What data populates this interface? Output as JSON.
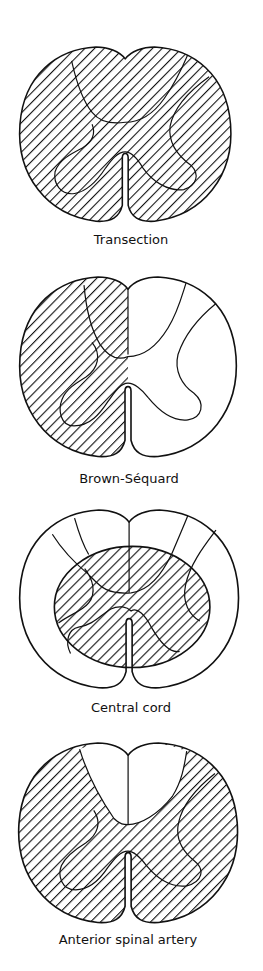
{
  "figure": {
    "hatch_color": "#111111",
    "panels": [
      {
        "id": "transection",
        "label": "Transection",
        "affected": "entire cross-section"
      },
      {
        "id": "brown-sequard",
        "label": "Brown-Séquard",
        "affected": "left hemisection"
      },
      {
        "id": "central-cord",
        "label": "Central cord",
        "affected": "central region (gray matter and inner white matter)"
      },
      {
        "id": "anterior-spinal-artery",
        "label": "Anterior spinal artery",
        "affected": "anterior two-thirds, sparing dorsal columns"
      }
    ]
  }
}
